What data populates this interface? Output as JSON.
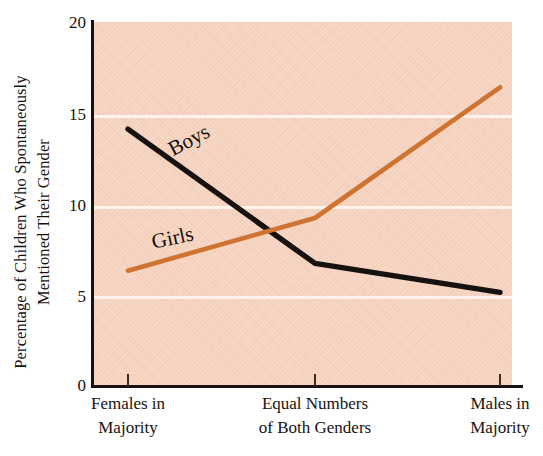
{
  "chart_data": {
    "type": "line",
    "title": "",
    "xlabel": "",
    "ylabel": "Percentage of Children Who Spontaneously Mentioned Their Gender",
    "ylabel_lines": [
      "Percentage of Children Who Spontaneously",
      "Mentioned Their Gender"
    ],
    "categories": [
      "Females in Majority",
      "Equal Numbers of Both Genders",
      "Males in Majority"
    ],
    "category_lines": [
      [
        "Females in",
        "Majority"
      ],
      [
        "Equal Numbers",
        "of Both Genders"
      ],
      [
        "Males in",
        "Majority"
      ]
    ],
    "series": [
      {
        "name": "Boys",
        "color": "#17120f",
        "values": [
          14.1,
          6.7,
          5.1
        ]
      },
      {
        "name": "Girls",
        "color": "#cf7331",
        "values": [
          6.3,
          9.2,
          16.4
        ]
      }
    ],
    "ylim": [
      0,
      20
    ],
    "yticks": [
      0,
      5,
      10,
      15,
      20
    ],
    "ytick_labels": [
      "0",
      "5",
      "10",
      "15",
      "20"
    ],
    "gridlines_y": [
      5,
      10,
      15
    ],
    "grid": true,
    "grid_color": "#fdf3ec",
    "legend_position": "inline-on-lines",
    "plot_background": "#f7d8c6",
    "figure_background": "#ffffff",
    "axis_color": "#17120f"
  }
}
